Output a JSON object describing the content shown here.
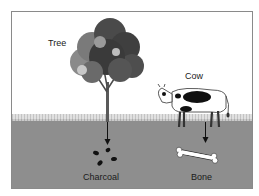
{
  "diagram": {
    "labels": {
      "tree": "Tree",
      "cow": "Cow",
      "charcoal": "Charcoal",
      "bone": "Bone"
    },
    "colors": {
      "ground": "#8e8e8e",
      "frame_border": "#8a8a8a",
      "tree_foliage": "#4a4a4a",
      "tree_foliage_light": "#8a8a8a",
      "cow_body": "#ffffff",
      "cow_spots": "#111111",
      "bone": "#ffffff",
      "charcoal": "#111111",
      "arrow": "#111111"
    }
  }
}
